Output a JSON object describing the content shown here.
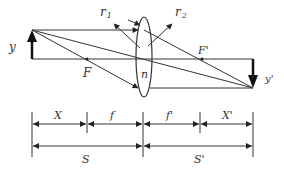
{
  "diagram": {
    "type": "thin-lens-imaging",
    "labels": {
      "object": "y",
      "image": "y'",
      "focal_front": "F",
      "focal_back": "F'",
      "radius_1": "r",
      "radius_1_sub": "1",
      "radius_2": "r",
      "radius_2_sub": "2",
      "index": "n"
    },
    "dimensions": {
      "row1": [
        "X",
        "f",
        "f'",
        "X'"
      ],
      "row2": [
        "S",
        "S'"
      ]
    },
    "colors": {
      "line": "#333333",
      "background": "#ffffff"
    }
  }
}
